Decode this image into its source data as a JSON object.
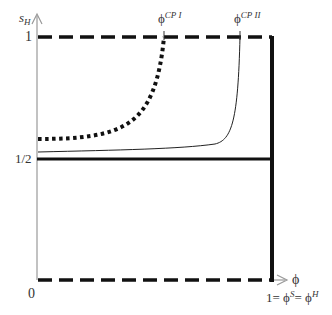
{
  "diagram": {
    "y_axis": {
      "label_main": "s",
      "label_sub": "H",
      "ticks": [
        {
          "label": "1",
          "value": 1
        },
        {
          "label": "1/2",
          "value": 0.5
        },
        {
          "label": "0",
          "value": 0
        }
      ]
    },
    "x_axis": {
      "label": "ϕ",
      "end_label": {
        "prefix": "1= ϕ",
        "sup1": "S",
        "mid": "= ϕ",
        "sup2": "H"
      }
    },
    "critical_points": [
      {
        "symbol": "ϕ",
        "sup": "CP I"
      },
      {
        "symbol": "ϕ",
        "sup": "CP II"
      }
    ],
    "curves": [
      {
        "name": "boundary-top",
        "style": "dashed-thick",
        "y": 1
      },
      {
        "name": "boundary-bottom",
        "style": "dashed-thick",
        "y": 0
      },
      {
        "name": "half-line",
        "style": "solid-thick",
        "y": 0.5
      },
      {
        "name": "right-boundary",
        "style": "solid-thick",
        "x": 1
      },
      {
        "name": "curve-I",
        "style": "dotted-thick",
        "ends_at": "CP I"
      },
      {
        "name": "curve-II",
        "style": "solid-thin",
        "ends_at": "CP II"
      }
    ],
    "colors": {
      "line": "#111111",
      "axis": "#888888",
      "text": "#333333"
    }
  }
}
